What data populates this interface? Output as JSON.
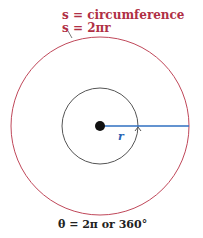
{
  "labels": {
    "circumference_def": "s = circumference",
    "circumference_formula": "s = 2πr",
    "radius": "r",
    "angle": "θ = 2π or 360°"
  },
  "geometry": {
    "center": [
      100,
      126
    ],
    "outer_radius": 89,
    "inner_radius": 38,
    "dot_radius": 5
  },
  "colors": {
    "outer_circle": "#c0485a",
    "inner_circle": "#555555",
    "radius_line": "#2f6fc0",
    "text_red": "#b03045",
    "text_blue": "#2a62b5",
    "text_dark": "#222222"
  }
}
